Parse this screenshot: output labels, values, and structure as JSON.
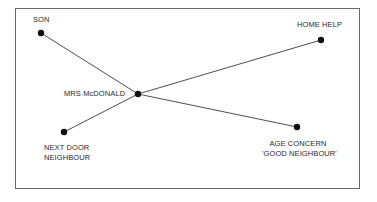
{
  "diagram": {
    "type": "social network / sociogram",
    "center_node": {
      "id": "mrs-mcdonald",
      "label": "MRS McDONALD",
      "x": 138,
      "y": 94
    },
    "nodes": [
      {
        "id": "son",
        "label": "SON",
        "x": 41,
        "y": 33
      },
      {
        "id": "home-help",
        "label": "HOME HELP",
        "x": 321,
        "y": 40
      },
      {
        "id": "next-door-neighbour",
        "label_line1": "NEXT DOOR",
        "label_line2": "NEIGHBOUR",
        "x": 64,
        "y": 132
      },
      {
        "id": "age-concern",
        "label_line1": "AGE CONCERN",
        "label_line2": "'GOOD NEIGHBOUR'",
        "x": 297,
        "y": 127
      }
    ],
    "edges": [
      {
        "from": "mrs-mcdonald",
        "to": "son"
      },
      {
        "from": "mrs-mcdonald",
        "to": "home-help"
      },
      {
        "from": "mrs-mcdonald",
        "to": "next-door-neighbour"
      },
      {
        "from": "mrs-mcdonald",
        "to": "age-concern"
      }
    ],
    "colors": {
      "line": "#3a3a3a",
      "node": "#111111",
      "border": "#6a6a6a",
      "text": "#2a2a2a"
    }
  }
}
